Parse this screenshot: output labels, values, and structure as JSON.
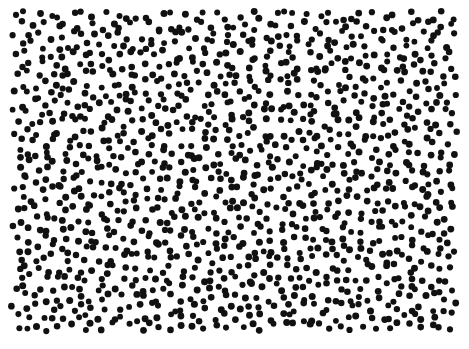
{
  "image": {
    "width": 469,
    "height": 349,
    "background": "#ffffff",
    "dot_color": "#111111",
    "dot_radius": 3.2,
    "region": {
      "x0": 16,
      "y0": 16,
      "x1": 458,
      "y1": 330
    },
    "spacing": 11.2,
    "jitter": 0.42,
    "seed": 20240517,
    "description": "Random dot pattern of roughly 1100 black dots on white"
  }
}
